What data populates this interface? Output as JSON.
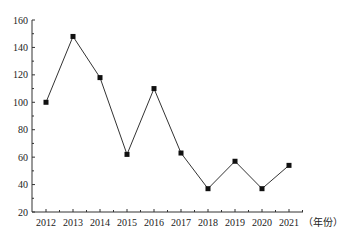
{
  "chart_data": {
    "type": "line",
    "title": "",
    "xlabel": "（年份）",
    "ylabel": "",
    "categories": [
      "2012",
      "2013",
      "2014",
      "2015",
      "2016",
      "2017",
      "2018",
      "2019",
      "2020",
      "2021"
    ],
    "series": [
      {
        "name": "",
        "values": [
          100,
          148,
          118,
          62,
          110,
          63,
          37,
          57,
          37,
          54
        ],
        "marker": "square",
        "color": "#111111"
      }
    ],
    "ylim": [
      20,
      160
    ],
    "yticks": [
      20,
      40,
      60,
      80,
      100,
      120,
      140,
      160
    ],
    "grid": false,
    "legend": "none"
  },
  "layout": {
    "x_axis_start": 32,
    "x_axis_end": 303,
    "first_x": 46,
    "x_step": 27,
    "y_top_px": 20,
    "y_bottom_px": 212
  }
}
